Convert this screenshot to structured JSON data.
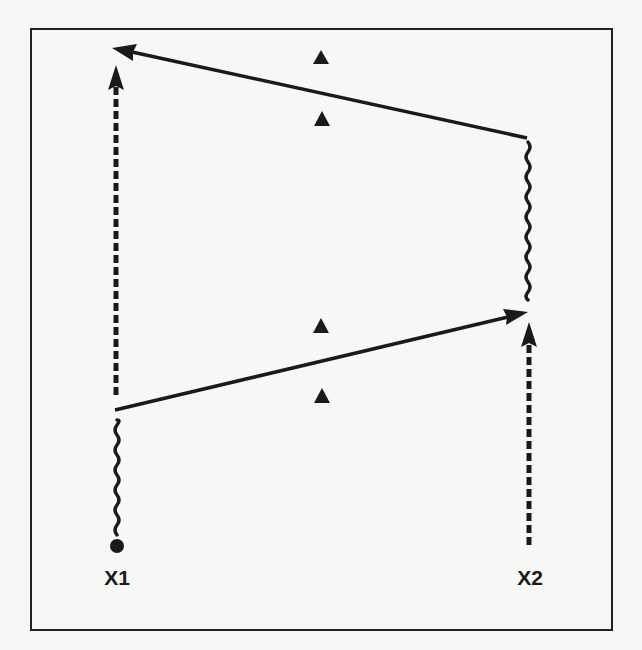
{
  "diagram": {
    "type": "signal-exchange / timing diagram",
    "frame": {
      "x": 31,
      "y": 29,
      "width": 581,
      "height": 601,
      "stroke": "#222222"
    },
    "colors": {
      "ink": "#1a1a1a",
      "background": "#f7f7f5"
    },
    "nodes": [
      {
        "id": "X1",
        "label": "X1",
        "x": 117,
        "label_y": 585
      },
      {
        "id": "X2",
        "label": "X2",
        "x": 529,
        "label_y": 585
      }
    ],
    "start_marker": {
      "node": "X1",
      "shape": "filled-circle",
      "x": 117,
      "y": 546
    },
    "segments": [
      {
        "name": "x1-wavy-segment",
        "node": "X1",
        "style": "wavy",
        "y_from": 535,
        "y_to": 420
      },
      {
        "name": "x1-dashed-arrow",
        "node": "X1",
        "style": "dashed-arrow-up",
        "y_from": 395,
        "y_to": 65
      },
      {
        "name": "x2-dashed-arrow",
        "node": "X2",
        "style": "dashed-arrow-up",
        "y_from": 545,
        "y_to": 322
      },
      {
        "name": "x2-wavy-segment",
        "node": "X2",
        "style": "wavy",
        "y_from": 300,
        "y_to": 142
      }
    ],
    "messages": [
      {
        "name": "message-x1-to-x2",
        "from": [
          115,
          410
        ],
        "to": [
          528,
          312
        ],
        "direction": "X1 → X2"
      },
      {
        "name": "message-x2-to-x1",
        "from": [
          527,
          138
        ],
        "to": [
          112,
          48
        ],
        "direction": "X2 → X1"
      }
    ],
    "markers": [
      {
        "name": "triangle-marker-1",
        "shape": "triangle",
        "x": 321,
        "y": 58
      },
      {
        "name": "triangle-marker-2",
        "shape": "triangle",
        "x": 322,
        "y": 119
      },
      {
        "name": "triangle-marker-3",
        "shape": "triangle",
        "x": 321,
        "y": 326
      },
      {
        "name": "triangle-marker-4",
        "shape": "triangle",
        "x": 322,
        "y": 396
      }
    ]
  },
  "labels": {
    "x1": "X1",
    "x2": "X2"
  }
}
